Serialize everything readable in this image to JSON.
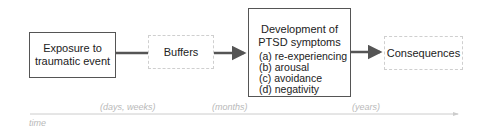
{
  "diagram": {
    "nodes": {
      "exposure": {
        "lines": [
          "Exposure to",
          "traumatic event"
        ],
        "style": "solid"
      },
      "buffers": {
        "label": "Buffers",
        "style": "dashed"
      },
      "development": {
        "title_lines": [
          "Development of",
          "PTSD symptoms"
        ],
        "items": [
          "(a) re-experiencing",
          "(b) arousal",
          "(c) avoidance",
          "(d) negativity"
        ],
        "style": "solid"
      },
      "consequences": {
        "label": "Consequences",
        "style": "dashed"
      }
    },
    "edges": [
      {
        "from": "exposure",
        "to": "buffers",
        "type": "line"
      },
      {
        "from": "buffers",
        "to": "development",
        "type": "arrow"
      },
      {
        "from": "development",
        "to": "consequences",
        "type": "arrow"
      }
    ],
    "timeline": {
      "axis_label": "time",
      "labels": [
        "(days, weeks)",
        "(months)",
        "(years)"
      ]
    },
    "colors": {
      "solid_border": "#555555",
      "dashed_border": "#cfcfcf",
      "arrow": "#555555",
      "timeline": "#cccccc",
      "timeline_text": "#b9b9b9"
    }
  }
}
